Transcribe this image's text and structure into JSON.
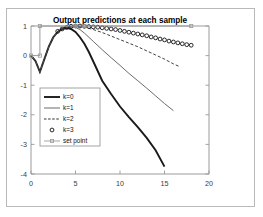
{
  "figure": {
    "title": "Output predictions at each sample",
    "frame_color": "#b9b9b9",
    "axes_color": "#9a9a9a",
    "background": "#ffffff"
  },
  "chart_data": {
    "type": "line",
    "title": "Output predictions at each sample",
    "xlabel": "",
    "ylabel": "",
    "xlim": [
      0,
      20
    ],
    "ylim": [
      -4,
      1
    ],
    "xticks": [
      0,
      5,
      10,
      15,
      20
    ],
    "yticks": [
      1,
      0,
      -1,
      -2,
      -3,
      -4
    ],
    "xtick_labels": [
      "0",
      "5",
      "10",
      "15",
      "20"
    ],
    "ytick_labels": [
      "1",
      "0",
      "-1",
      "-2",
      "-3",
      "-4"
    ],
    "grid": false,
    "legend_position": "center-left",
    "series": [
      {
        "name": "k=0",
        "style": "solid",
        "width": 1.9,
        "color": "#1a1a1a",
        "x": [
          0,
          0.5,
          1,
          1.5,
          2,
          2.5,
          3,
          3.5,
          4,
          4.5,
          5,
          5.5,
          6,
          6.5,
          7,
          8,
          9,
          10,
          11,
          12,
          13,
          14,
          15
        ],
        "y": [
          0.0,
          -0.18,
          -0.55,
          -0.12,
          0.3,
          0.62,
          0.8,
          0.9,
          0.94,
          0.9,
          0.8,
          0.62,
          0.4,
          0.12,
          -0.2,
          -0.85,
          -1.3,
          -1.72,
          -2.08,
          -2.42,
          -2.78,
          -3.2,
          -3.75
        ]
      },
      {
        "name": "k=1",
        "style": "solid",
        "width": 0.9,
        "color": "#5a5a5a",
        "x": [
          0,
          0.5,
          1,
          1.5,
          2,
          2.5,
          3,
          3.5,
          4,
          4.5,
          5,
          5.5,
          6,
          7,
          8,
          9,
          10,
          11,
          12,
          13,
          14,
          15,
          16
        ],
        "y": [
          0.0,
          -0.18,
          -0.55,
          -0.12,
          0.3,
          0.62,
          0.8,
          0.9,
          0.95,
          0.97,
          0.95,
          0.88,
          0.76,
          0.48,
          0.2,
          -0.07,
          -0.33,
          -0.6,
          -0.85,
          -1.1,
          -1.36,
          -1.62,
          -1.86
        ]
      },
      {
        "name": "k=2",
        "style": "dashed",
        "width": 0.9,
        "color": "#2a2a2a",
        "x": [
          0,
          0.5,
          1,
          1.5,
          2,
          2.5,
          3,
          3.5,
          4,
          4.5,
          5,
          6,
          7,
          8,
          9,
          10,
          11,
          12,
          13,
          14,
          15,
          16,
          16.6
        ],
        "y": [
          0.0,
          -0.18,
          -0.55,
          -0.12,
          0.3,
          0.62,
          0.8,
          0.9,
          0.96,
          0.99,
          1.0,
          0.96,
          0.88,
          0.78,
          0.66,
          0.54,
          0.42,
          0.3,
          0.16,
          0.02,
          -0.12,
          -0.28,
          -0.36
        ]
      },
      {
        "name": "k=3",
        "style": "markers",
        "marker": "circle",
        "color": "#111111",
        "x": [
          3,
          3.5,
          4,
          4.5,
          5,
          5.5,
          6,
          6.5,
          7,
          7.5,
          8,
          8.5,
          9,
          9.5,
          10,
          10.5,
          11,
          11.5,
          12,
          12.5,
          13,
          13.5,
          14,
          14.5,
          15,
          15.5,
          16,
          16.5,
          17,
          17.5,
          18
        ],
        "y": [
          0.82,
          0.9,
          0.95,
          0.99,
          1.0,
          1.0,
          0.99,
          0.98,
          0.97,
          0.96,
          0.94,
          0.92,
          0.9,
          0.88,
          0.85,
          0.82,
          0.79,
          0.76,
          0.73,
          0.7,
          0.67,
          0.63,
          0.6,
          0.56,
          0.53,
          0.49,
          0.46,
          0.43,
          0.4,
          0.37,
          0.35
        ]
      },
      {
        "name": "set point",
        "style": "step-markers",
        "marker": "square",
        "color": "#9a9a9a",
        "x": [
          0,
          1,
          1,
          18
        ],
        "y": [
          0,
          0,
          1,
          1
        ],
        "marker_x": [
          0,
          1,
          1,
          5,
          6,
          18
        ],
        "marker_y": [
          0,
          0,
          1,
          1,
          1,
          1
        ]
      }
    ]
  },
  "legend": {
    "items": [
      {
        "label": "k=0",
        "kind": "line-thick"
      },
      {
        "label": "k=1",
        "kind": "line-thin"
      },
      {
        "label": "k=2",
        "kind": "line-dashed"
      },
      {
        "label": "k=3",
        "kind": "marker-circle"
      },
      {
        "label": "set point",
        "kind": "line-square-marker"
      }
    ]
  }
}
